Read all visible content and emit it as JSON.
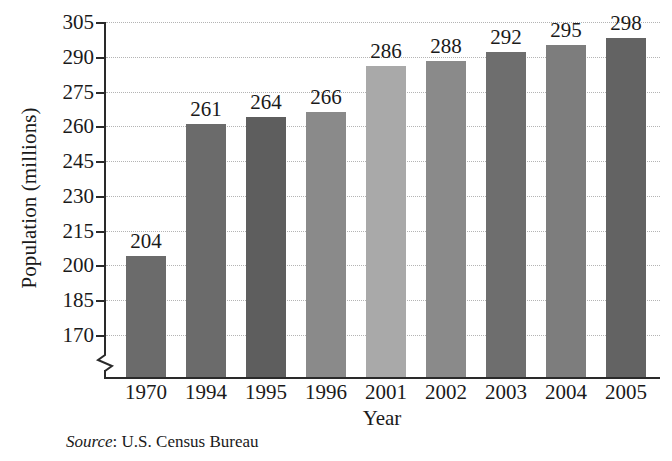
{
  "chart_data": {
    "type": "bar",
    "title": "",
    "xlabel": "Year",
    "ylabel": "Population (millions)",
    "categories": [
      "1970",
      "1994",
      "1995",
      "1996",
      "2001",
      "2002",
      "2003",
      "2004",
      "2005"
    ],
    "values": [
      204,
      261,
      264,
      266,
      286,
      288,
      292,
      295,
      298
    ],
    "value_labels": [
      "204",
      "261",
      "264",
      "266",
      "286",
      "288",
      "292",
      "295",
      "298"
    ],
    "bar_colors": [
      "#6b6b6b",
      "#6b6b6b",
      "#5e5e5e",
      "#8a8a8a",
      "#a9a9a9",
      "#8a8a8a",
      "#6e6e6e",
      "#7d7d7d",
      "#636363"
    ],
    "ylim": [
      163,
      305
    ],
    "yticks": [
      170,
      185,
      200,
      215,
      230,
      245,
      260,
      275,
      290,
      305
    ],
    "ytick_labels": [
      "170",
      "185",
      "200",
      "215",
      "230",
      "245",
      "260",
      "275",
      "290",
      "305"
    ],
    "axis_break": true,
    "grid": true,
    "grid_style": "dotted",
    "legend": "none"
  },
  "source": {
    "label": "Source",
    "separator": ": ",
    "text": "U.S. Census Bureau"
  }
}
